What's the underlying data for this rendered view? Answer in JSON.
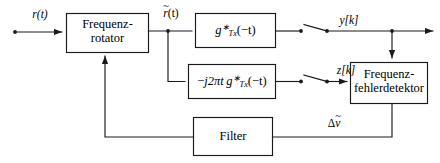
{
  "diagram": {
    "type": "block-diagram",
    "background": "#ffffff",
    "line_color": "#1a1a1a",
    "blocks": [
      {
        "id": "frequenzrotator",
        "line1": "Frequenz-",
        "line2": "rotator"
      },
      {
        "id": "matched-filter",
        "label": "g*Tx(-t)"
      },
      {
        "id": "derivative-filter",
        "label": "-j2πt g*Tx(-t)"
      },
      {
        "id": "frequenzfehlerdetektor",
        "line1": "Frequenz-",
        "line2": "fehlerdetektor"
      },
      {
        "id": "loop-filter",
        "label": "Filter"
      }
    ],
    "signals": {
      "input": "r(t)",
      "rotated": "r̃(t)",
      "y_out": "y[k]",
      "z_out": "z[k]",
      "error": "Δṽ"
    },
    "symbols": {
      "tilde": "~",
      "minus": "−",
      "j": "j",
      "two_pi_t": "2πt",
      "g": "g",
      "star": "∗",
      "tx": "Tx",
      "arg_minus_t": "(−t)",
      "delta": "Δ",
      "v": "v",
      "y": "y",
      "z": "z",
      "k_bracket_open": "[",
      "k": "k",
      "k_bracket_close": "]",
      "r": "r",
      "t_paren": "(t)"
    },
    "switches": [
      {
        "id": "sampler-y",
        "state": "open"
      },
      {
        "id": "sampler-z",
        "state": "open"
      }
    ]
  }
}
